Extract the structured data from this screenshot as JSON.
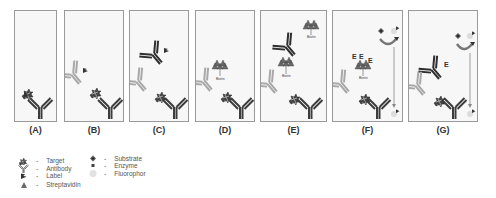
{
  "panels": [
    {
      "id": "A",
      "label": "(A)"
    },
    {
      "id": "B",
      "label": "(B)"
    },
    {
      "id": "C",
      "label": "(C)"
    },
    {
      "id": "D",
      "label": "(D)"
    },
    {
      "id": "E",
      "label": "(E)"
    },
    {
      "id": "F",
      "label": "(F)"
    },
    {
      "id": "G",
      "label": "(G)"
    }
  ],
  "annotations": {
    "biotin": "Biotin",
    "enzyme": "E"
  },
  "legend": {
    "dash": "-",
    "items": [
      {
        "icon": "target-icon",
        "label": "Target"
      },
      {
        "icon": "antibody-icon",
        "label": "Antibody"
      },
      {
        "icon": "label-icon",
        "label": "Label"
      },
      {
        "icon": "streptavidin-icon",
        "label": "Streptavidin"
      },
      {
        "icon": "substrate-icon",
        "label": "Substrate"
      },
      {
        "icon": "enzyme-icon",
        "label": "Enzyme"
      },
      {
        "icon": "fluorophor-icon",
        "label": "Fluorophor"
      }
    ]
  },
  "colors": {
    "capture_antibody": "#3c3c3c",
    "primary_antibody": "#a8a8a8",
    "secondary_antibody": "#2e2e2e",
    "streptavidin": "#6a6a6a",
    "fluorophor": "#dcdcdc",
    "panel_border": "#9a9a9a"
  }
}
